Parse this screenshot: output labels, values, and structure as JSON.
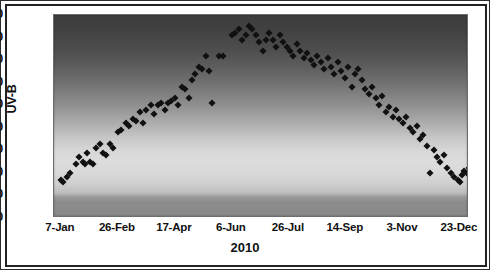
{
  "chart_data": {
    "type": "scatter",
    "title": "",
    "xlabel": "2010",
    "ylabel": "UV-B",
    "ylim": [
      0,
      90
    ],
    "ytick_step": 10,
    "yticks": [
      90,
      80,
      70,
      60,
      50,
      40,
      30,
      20,
      10,
      0
    ],
    "xticks": [
      "7-Jan",
      "26-Feb",
      "17-Apr",
      "6-Jun",
      "26-Jul",
      "14-Sep",
      "3-Nov",
      "23-Dec"
    ],
    "xtick_day_of_year": [
      7,
      57,
      107,
      157,
      207,
      257,
      307,
      357
    ],
    "xlim_day_of_year": [
      1,
      365
    ],
    "grid": false,
    "legend": null,
    "marker": "filled-diamond",
    "marker_color": "#111111",
    "background": "vertical grayscale gradient, dark at top, light near lower third",
    "series": [
      {
        "name": "UV-B",
        "points": [
          [
            7,
            17
          ],
          [
            9,
            16
          ],
          [
            12,
            18
          ],
          [
            15,
            20
          ],
          [
            20,
            24
          ],
          [
            23,
            27
          ],
          [
            26,
            25
          ],
          [
            28,
            24
          ],
          [
            30,
            29
          ],
          [
            33,
            25
          ],
          [
            35,
            24
          ],
          [
            38,
            31
          ],
          [
            41,
            33
          ],
          [
            44,
            29
          ],
          [
            47,
            28
          ],
          [
            50,
            33
          ],
          [
            53,
            31
          ],
          [
            57,
            38
          ],
          [
            60,
            39
          ],
          [
            64,
            42
          ],
          [
            67,
            41
          ],
          [
            70,
            44
          ],
          [
            73,
            43
          ],
          [
            76,
            47
          ],
          [
            79,
            42
          ],
          [
            82,
            48
          ],
          [
            86,
            50
          ],
          [
            89,
            46
          ],
          [
            92,
            50
          ],
          [
            95,
            51
          ],
          [
            98,
            48
          ],
          [
            101,
            51
          ],
          [
            104,
            52
          ],
          [
            107,
            53
          ],
          [
            110,
            50
          ],
          [
            113,
            58
          ],
          [
            116,
            57
          ],
          [
            119,
            53
          ],
          [
            122,
            61
          ],
          [
            125,
            64
          ],
          [
            128,
            67
          ],
          [
            131,
            66
          ],
          [
            134,
            72
          ],
          [
            137,
            65
          ],
          [
            140,
            51
          ],
          [
            146,
            72
          ],
          [
            149,
            72
          ],
          [
            157,
            81
          ],
          [
            160,
            82
          ],
          [
            163,
            84
          ],
          [
            166,
            79
          ],
          [
            169,
            81
          ],
          [
            172,
            85
          ],
          [
            175,
            84
          ],
          [
            178,
            81
          ],
          [
            181,
            78
          ],
          [
            184,
            74
          ],
          [
            187,
            79
          ],
          [
            190,
            82
          ],
          [
            193,
            79
          ],
          [
            196,
            76
          ],
          [
            199,
            81
          ],
          [
            202,
            78
          ],
          [
            205,
            76
          ],
          [
            208,
            74
          ],
          [
            211,
            72
          ],
          [
            214,
            77
          ],
          [
            217,
            74
          ],
          [
            220,
            71
          ],
          [
            223,
            73
          ],
          [
            226,
            70
          ],
          [
            229,
            68
          ],
          [
            232,
            72
          ],
          [
            235,
            69
          ],
          [
            238,
            66
          ],
          [
            241,
            71
          ],
          [
            244,
            67
          ],
          [
            247,
            64
          ],
          [
            250,
            69
          ],
          [
            253,
            65
          ],
          [
            256,
            62
          ],
          [
            259,
            67
          ],
          [
            262,
            58
          ],
          [
            265,
            64
          ],
          [
            268,
            66
          ],
          [
            271,
            61
          ],
          [
            274,
            57
          ],
          [
            277,
            55
          ],
          [
            280,
            58
          ],
          [
            283,
            53
          ],
          [
            286,
            50
          ],
          [
            289,
            54
          ],
          [
            292,
            47
          ],
          [
            295,
            49
          ],
          [
            298,
            45
          ],
          [
            301,
            48
          ],
          [
            304,
            44
          ],
          [
            307,
            42
          ],
          [
            310,
            45
          ],
          [
            313,
            40
          ],
          [
            316,
            38
          ],
          [
            319,
            41
          ],
          [
            322,
            35
          ],
          [
            325,
            37
          ],
          [
            328,
            32
          ],
          [
            331,
            20
          ],
          [
            334,
            30
          ],
          [
            337,
            27
          ],
          [
            340,
            25
          ],
          [
            343,
            28
          ],
          [
            346,
            22
          ],
          [
            349,
            20
          ],
          [
            352,
            18
          ],
          [
            355,
            17
          ],
          [
            357,
            16
          ],
          [
            359,
            19
          ],
          [
            361,
            21
          ],
          [
            363,
            20
          ],
          [
            365,
            22
          ]
        ]
      }
    ]
  },
  "axes": {
    "y_title": "UV-B",
    "x_title": "2010"
  }
}
